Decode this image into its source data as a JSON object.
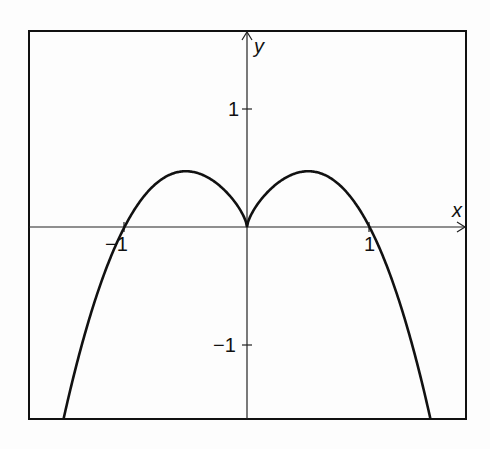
{
  "chart_data": {
    "type": "line",
    "title": "",
    "xlabel": "x",
    "ylabel": "y",
    "function": "y = |x|^(2/3) * (1 - x^2)",
    "xlim": [
      -1.78,
      1.79
    ],
    "ylim": [
      -1.63,
      1.66
    ],
    "grid": false,
    "legend": null,
    "x_ticks": [
      -1,
      1
    ],
    "y_ticks": [
      -1,
      1
    ],
    "tick_labels": {
      "x_neg": "−1",
      "x_pos": "1",
      "y_pos": "1",
      "y_neg": "−1"
    },
    "series": [
      {
        "name": "curve",
        "color": "#111111",
        "x": [
          -1.49,
          -1.25,
          -1.0,
          -0.75,
          -0.5,
          -0.25,
          0.0,
          0.25,
          0.5,
          0.75,
          1.0,
          1.25,
          1.49
        ],
        "y": [
          -1.63,
          -0.65,
          0.0,
          0.36,
          0.47,
          0.37,
          0.0,
          0.37,
          0.47,
          0.36,
          0.0,
          -0.65,
          -1.63
        ]
      }
    ],
    "annotations": [
      "cusp at origin (0,0)",
      "local maxima at x = ±0.5, y ≈ 0.47",
      "x-intercepts at −1, 0, 1"
    ]
  },
  "colors": {
    "ink": "#111111",
    "background": "#fdfdfd"
  }
}
